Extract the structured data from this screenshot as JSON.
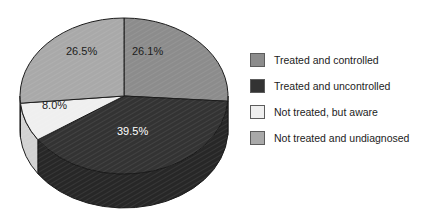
{
  "chart_data": {
    "type": "pie",
    "title": "",
    "subtitle": "",
    "xlabel": "",
    "ylabel": "",
    "grid": false,
    "legend_position": "right",
    "three_d": true,
    "background": "#ffffff",
    "categories": [
      "Treated and controlled",
      "Treated and uncontrolled",
      "Not treated, but aware",
      "Not treated and undiagnosed"
    ],
    "values": [
      26.1,
      39.5,
      8.0,
      26.5
    ],
    "value_labels": [
      "26.1%",
      "39.5%",
      "8.0%",
      "26.5%"
    ],
    "colors": [
      "#8c8c8c",
      "#333333",
      "#efefef",
      "#a9a9a9"
    ],
    "label_text_colors": [
      "#1c1c1c",
      "#ffffff",
      "#1c1c1c",
      "#1c1c1c"
    ],
    "slices": [
      {
        "label": "Treated and controlled",
        "value": 26.1,
        "display": "26.1%",
        "color": "#8c8c8c",
        "side_color": "#6f6f6f"
      },
      {
        "label": "Treated and uncontrolled",
        "value": 39.5,
        "display": "39.5%",
        "color": "#333333",
        "side_color": "#272727"
      },
      {
        "label": "Not treated, but aware",
        "value": 8.0,
        "display": "8.0%",
        "color": "#efefef",
        "side_color": "#d2d2d2"
      },
      {
        "label": "Not treated and undiagnosed",
        "value": 26.5,
        "display": "26.5%",
        "color": "#a9a9a9",
        "side_color": "#8b8b8b"
      }
    ]
  },
  "legend": {
    "items": [
      {
        "label": "Treated and controlled",
        "color": "#8c8c8c"
      },
      {
        "label": "Treated and uncontrolled",
        "color": "#333333"
      },
      {
        "label": "Not treated, but aware",
        "color": "#efefef"
      },
      {
        "label": "Not treated and undiagnosed",
        "color": "#a9a9a9"
      }
    ]
  },
  "labels": {
    "top_right": "26.1%",
    "top_left": "26.5%",
    "left": "8.0%",
    "bottom": "39.5%"
  }
}
